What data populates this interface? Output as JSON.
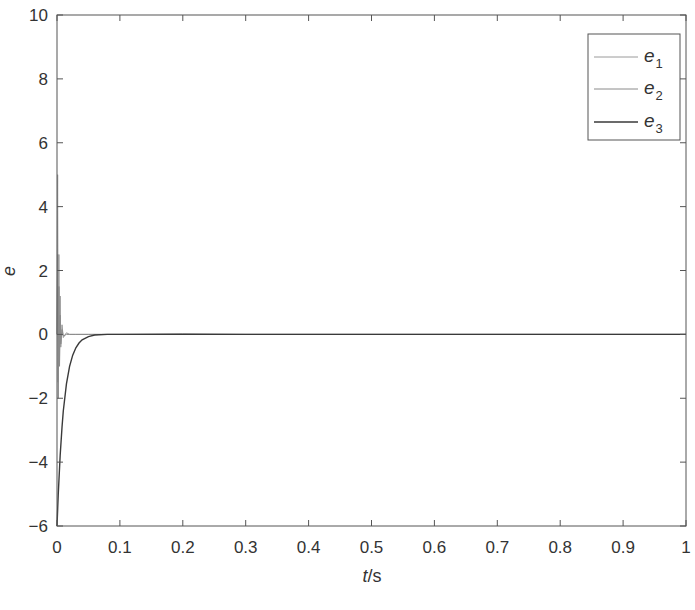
{
  "chart_data": {
    "type": "line",
    "title": "",
    "xlabel": "t/s",
    "xlabel_italic_part": "t",
    "xlabel_rest": "/s",
    "ylabel": "e",
    "xlim": [
      0,
      1
    ],
    "ylim": [
      -6,
      10
    ],
    "x_ticks": [
      0,
      0.1,
      0.2,
      0.3,
      0.4,
      0.5,
      0.6,
      0.7,
      0.8,
      0.9,
      1
    ],
    "x_tick_labels": [
      "0",
      "0.1",
      "0.2",
      "0.3",
      "0.4",
      "0.5",
      "0.6",
      "0.7",
      "0.8",
      "0.9",
      "1"
    ],
    "y_ticks": [
      -6,
      -4,
      -2,
      0,
      2,
      4,
      6,
      8,
      10
    ],
    "y_tick_labels": [
      "−6",
      "−4",
      "−2",
      "0",
      "2",
      "4",
      "6",
      "8",
      "10"
    ],
    "grid": false,
    "legend_position": "upper right",
    "series": [
      {
        "name": "e1",
        "label_base": "e",
        "label_sub": "1",
        "color": "#9a9a9a",
        "x": [
          0,
          0.001,
          0.002,
          0.003,
          0.004,
          0.005,
          0.006,
          0.008,
          0.01,
          0.015,
          0.02,
          0.03,
          0.05,
          0.1,
          0.2,
          0.3,
          0.5,
          1.0
        ],
        "y": [
          0,
          5.0,
          -1.5,
          2.5,
          -0.8,
          1.2,
          -0.4,
          0.3,
          -0.1,
          0.05,
          0,
          0,
          0,
          0,
          0,
          0,
          0,
          0
        ]
      },
      {
        "name": "e2",
        "label_base": "e",
        "label_sub": "2",
        "color": "#8a8a8a",
        "x": [
          0,
          0.001,
          0.002,
          0.003,
          0.004,
          0.005,
          0.006,
          0.008,
          0.01,
          0.015,
          0.02,
          0.03,
          0.05,
          0.1,
          0.2,
          0.3,
          0.5,
          1.0
        ],
        "y": [
          0,
          2.5,
          -2.0,
          1.5,
          -1.0,
          0.6,
          -0.3,
          0.15,
          -0.05,
          0,
          0,
          0,
          0,
          0,
          0.02,
          0,
          0,
          0
        ]
      },
      {
        "name": "e3",
        "label_base": "e",
        "label_sub": "3",
        "color": "#3a3a3a",
        "x": [
          0,
          0.002,
          0.005,
          0.008,
          0.01,
          0.015,
          0.02,
          0.025,
          0.03,
          0.035,
          0.04,
          0.05,
          0.06,
          0.08,
          0.1,
          0.2,
          0.3,
          0.5,
          1.0
        ],
        "y": [
          -6,
          -5.0,
          -3.8,
          -2.9,
          -2.4,
          -1.55,
          -1.0,
          -0.65,
          -0.42,
          -0.27,
          -0.17,
          -0.07,
          -0.02,
          0,
          0,
          0,
          0,
          0,
          0
        ]
      }
    ]
  }
}
